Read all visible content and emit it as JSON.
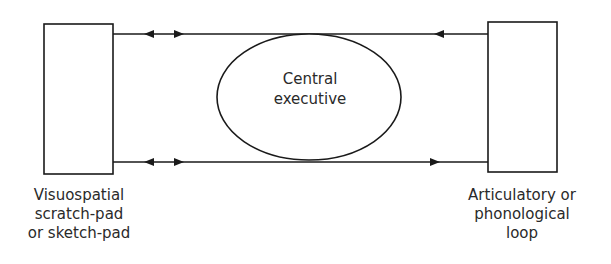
{
  "diagram": {
    "stroke_color": "#1a1a1a",
    "nodes": {
      "central_executive": {
        "shape": "ellipse",
        "lines": [
          "Central",
          "executive"
        ]
      },
      "visuospatial": {
        "shape": "rectangle",
        "lines": [
          "Visuospatial",
          "scratch-pad",
          "or sketch-pad"
        ]
      },
      "articulatory": {
        "shape": "rectangle",
        "lines": [
          "Articulatory or",
          "phonological",
          "loop"
        ]
      }
    },
    "edges": [
      {
        "from": "visuospatial",
        "to": "articulatory",
        "position": "top",
        "arrows": [
          "left-pointing near visuospatial",
          "right-pointing near visuospatial",
          "left-pointing near articulatory"
        ]
      },
      {
        "from": "visuospatial",
        "to": "articulatory",
        "position": "bottom",
        "arrows": [
          "left-pointing near visuospatial",
          "right-pointing near visuospatial",
          "right-pointing near articulatory"
        ]
      }
    ]
  }
}
